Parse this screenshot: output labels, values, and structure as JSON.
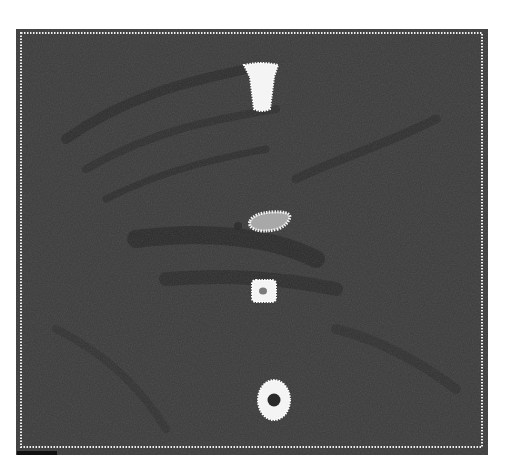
{
  "artwork": {
    "description": "Dark painted field with dotted white border and four white dotted motifs arranged vertically",
    "colors": {
      "background": "#3a3a3a",
      "dark_streaks": "#262626",
      "dots": "#f2f2f2",
      "inner_fill": "#9a9a9a"
    },
    "motifs": [
      {
        "name": "tapered-column",
        "shape": "trapezoid"
      },
      {
        "name": "oval",
        "shape": "ellipse"
      },
      {
        "name": "square-with-center",
        "shape": "rounded-square"
      },
      {
        "name": "ring",
        "shape": "circle-ring"
      }
    ]
  }
}
